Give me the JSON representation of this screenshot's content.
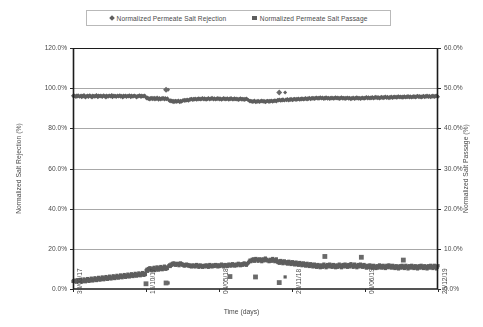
{
  "chart_data": {
    "type": "scatter",
    "title": "",
    "xlabel": "Time (days)",
    "ylabel": "Normalized Salt Rejection (%)",
    "y2label": "Normalized Salt Passage (%)",
    "grid": true,
    "legend_position": "top-center",
    "ylim": [
      0,
      120
    ],
    "y2lim": [
      0,
      60
    ],
    "ytick_labels": [
      "0.0%",
      "20.0%",
      "40.0%",
      "60.0%",
      "80.0%",
      "100.0%",
      "120.0%"
    ],
    "ytick_values": [
      0,
      20,
      40,
      60,
      80,
      100,
      120
    ],
    "y2tick_labels": [
      "0.0%",
      "10.0%",
      "20.0%",
      "30.0%",
      "40.0%",
      "50.0%",
      "60.0%"
    ],
    "y2tick_values": [
      0,
      10,
      20,
      30,
      40,
      50,
      60
    ],
    "xtick_labels": [
      "30/03/17",
      "16/10/17",
      "04/05/18",
      "20/11/18",
      "08/06/19",
      "25/12/19"
    ],
    "xtick_positions": [
      0,
      0.2,
      0.4,
      0.6,
      0.8,
      1.0
    ],
    "xlim_labels": [
      "30/03/17",
      "25/12/19"
    ],
    "series": [
      {
        "name": "Normalized Permeate  Salt Rejection",
        "marker": "diamond",
        "color": "#5e5e5e",
        "axis": "left",
        "values": [
          96.2,
          95.8,
          96.4,
          96.0,
          95.6,
          96.3,
          95.9,
          96.5,
          96.1,
          95.7,
          96.0,
          96.4,
          95.5,
          96.2,
          95.8,
          96.6,
          96.0,
          95.4,
          96.1,
          95.9,
          96.3,
          95.6,
          96.2,
          96.5,
          95.8,
          96.0,
          95.3,
          96.4,
          96.1,
          95.7,
          96.2,
          95.9,
          96.6,
          96.0,
          95.5,
          96.3,
          96.1,
          95.8,
          96.4,
          96.0,
          95.6,
          96.2,
          96.5,
          95.9,
          96.1,
          95.4,
          96.3,
          96.0,
          95.7,
          96.2,
          96.4,
          95.8,
          96.0,
          96.6,
          95.5,
          96.1,
          96.3,
          95.9,
          96.2,
          95.6,
          96.0,
          96.4,
          95.8,
          96.1,
          96.5,
          95.7,
          96.2,
          96.0,
          95.4,
          96.3,
          95.9,
          96.1,
          96.4,
          95.6,
          96.0,
          96.2,
          95.8,
          96.5,
          96.1,
          95.5,
          96.3,
          96.0,
          95.7,
          96.2,
          96.4,
          95.9,
          96.1,
          95.3,
          96.0,
          96.2,
          95.8,
          96.5,
          96.1,
          95.6,
          96.3,
          96.0,
          95.9,
          96.2,
          96.4,
          95.7,
          95.2,
          94.8,
          95.4,
          94.6,
          95.0,
          94.4,
          95.1,
          94.7,
          95.3,
          94.5,
          94.9,
          95.2,
          94.3,
          95.0,
          94.6,
          95.4,
          94.8,
          94.2,
          95.1,
          94.7,
          94.4,
          95.0,
          94.6,
          95.2,
          94.9,
          94.3,
          95.1,
          94.7,
          94.5,
          95.0,
          99.2,
          94.1,
          93.6,
          94.0,
          93.4,
          93.9,
          93.2,
          93.7,
          93.0,
          93.5,
          93.8,
          93.1,
          93.6,
          93.3,
          93.9,
          93.4,
          93.0,
          93.7,
          93.2,
          93.5,
          94.0,
          93.8,
          94.2,
          93.6,
          94.1,
          93.9,
          94.4,
          94.0,
          93.7,
          94.3,
          94.6,
          94.2,
          94.8,
          94.4,
          94.1,
          94.7,
          94.3,
          94.9,
          94.5,
          94.2,
          94.8,
          94.4,
          95.0,
          94.6,
          94.3,
          94.9,
          94.5,
          95.1,
          94.7,
          94.4,
          95.0,
          94.6,
          94.2,
          94.8,
          94.5,
          95.1,
          94.7,
          94.3,
          94.9,
          94.6,
          95.2,
          94.8,
          94.4,
          95.0,
          94.7,
          94.3,
          94.9,
          94.5,
          95.1,
          94.8,
          94.4,
          95.0,
          94.6,
          94.2,
          94.8,
          94.5,
          95.1,
          94.7,
          94.3,
          94.9,
          94.5,
          95.0,
          94.6,
          94.2,
          94.9,
          94.5,
          95.1,
          94.7,
          94.3,
          94.8,
          94.4,
          95.0,
          94.6,
          94.3,
          94.9,
          94.5,
          94.1,
          94.7,
          94.4,
          95.0,
          94.6,
          94.2,
          94.8,
          94.5,
          94.1,
          94.7,
          94.3,
          94.9,
          94.5,
          94.2,
          94.0,
          93.7,
          93.3,
          93.8,
          93.5,
          93.1,
          93.6,
          93.2,
          93.9,
          93.4,
          93.0,
          93.5,
          93.2,
          93.8,
          93.4,
          93.1,
          93.6,
          93.3,
          93.9,
          93.5,
          93.2,
          93.7,
          93.4,
          93.0,
          93.6,
          93.3,
          93.8,
          93.5,
          93.1,
          93.7,
          93.4,
          93.9,
          93.6,
          93.2,
          93.8,
          93.5,
          94.0,
          93.7,
          93.3,
          93.9,
          94.2,
          93.8,
          94.4,
          94.0,
          93.7,
          94.3,
          93.9,
          94.5,
          94.1,
          93.8,
          97.8,
          94.4,
          94.0,
          94.6,
          94.2,
          93.9,
          94.5,
          94.1,
          94.7,
          94.3,
          94.0,
          94.6,
          94.2,
          94.8,
          94.4,
          94.1,
          94.7,
          94.3,
          94.9,
          94.5,
          94.2,
          94.8,
          94.4,
          95.0,
          94.6,
          94.3,
          94.9,
          94.5,
          95.1,
          94.7,
          94.4,
          95.0,
          94.6,
          95.2,
          94.8,
          94.5,
          95.1,
          94.7,
          95.3,
          94.9,
          94.6,
          95.2,
          94.8,
          95.4,
          95.0,
          94.7,
          95.3,
          94.9,
          95.5,
          95.1,
          94.8,
          95.4,
          95.0,
          94.6,
          95.2,
          94.9,
          95.5,
          95.1,
          94.7,
          95.3,
          95.0,
          94.6,
          95.2,
          94.8,
          95.4,
          95.0,
          94.7,
          95.3,
          94.9,
          95.5,
          95.1,
          94.8,
          95.4,
          95.0,
          94.6,
          95.2,
          94.9,
          95.5,
          95.1,
          94.7,
          95.3,
          95.0,
          94.6,
          95.2,
          94.8,
          95.4,
          95.1,
          94.7,
          95.3,
          94.9,
          94.5,
          95.1,
          94.8,
          95.4,
          95.0,
          94.6,
          95.2,
          94.9,
          95.5,
          95.1,
          94.7,
          95.3,
          95.0,
          94.6,
          95.2,
          94.8,
          95.4,
          95.0,
          94.7,
          95.3,
          95.0,
          95.6,
          95.2,
          94.9,
          95.5,
          95.1,
          94.8,
          95.4,
          95.0,
          95.6,
          95.2,
          94.9,
          95.5,
          95.1,
          95.7,
          95.3,
          95.0,
          95.6,
          95.2,
          94.9,
          95.5,
          95.1,
          95.7,
          95.3,
          95.0,
          95.6,
          95.2,
          95.8,
          95.4,
          95.1,
          95.7,
          95.3,
          95.0,
          95.6,
          95.2,
          95.8,
          95.4,
          95.1,
          95.7,
          95.3,
          95.9,
          95.5,
          95.2,
          95.8,
          95.4,
          96.0,
          95.6,
          95.3,
          95.9,
          95.5,
          95.2,
          95.8,
          95.4,
          96.0,
          95.6,
          95.3,
          95.9,
          95.5,
          96.1,
          95.7,
          95.4,
          96.0,
          95.6,
          95.3,
          95.9,
          95.5,
          96.1,
          95.7,
          95.4,
          96.0,
          95.6,
          96.2,
          95.8,
          95.5,
          96.1,
          95.7,
          95.4,
          96.0,
          95.6,
          96.2,
          95.8,
          95.5,
          96.1,
          95.7,
          96.3,
          95.9,
          95.6,
          96.2,
          95.8,
          95.5,
          96.1,
          95.7,
          96.3,
          95.9,
          95.6,
          96.2,
          95.8,
          96.4,
          96.0,
          95.7
        ]
      },
      {
        "name": "Normalized Permeate  Salt Passage",
        "marker": "square",
        "color": "#5e5e5e",
        "axis": "right",
        "values": [
          1.9,
          2.1,
          1.8,
          2.2,
          2.0,
          1.7,
          2.3,
          1.9,
          2.1,
          1.8,
          2.4,
          2.0,
          1.7,
          2.2,
          1.9,
          2.5,
          2.1,
          1.8,
          2.3,
          2.0,
          2.6,
          2.2,
          1.9,
          2.4,
          2.1,
          2.7,
          2.3,
          2.0,
          2.5,
          2.2,
          2.8,
          2.4,
          2.1,
          2.6,
          2.3,
          2.9,
          2.5,
          2.2,
          2.7,
          2.4,
          3.0,
          2.6,
          2.3,
          2.8,
          2.5,
          3.1,
          2.7,
          2.4,
          2.9,
          2.6,
          3.2,
          2.8,
          2.5,
          3.0,
          2.7,
          3.3,
          2.9,
          2.6,
          3.1,
          2.8,
          3.4,
          3.0,
          2.7,
          3.2,
          2.9,
          3.5,
          3.1,
          2.8,
          3.3,
          3.0,
          3.6,
          3.2,
          2.9,
          3.4,
          3.1,
          3.7,
          3.3,
          3.0,
          3.5,
          3.2,
          3.8,
          3.4,
          3.1,
          3.6,
          3.3,
          3.9,
          3.5,
          3.2,
          3.7,
          3.4,
          4.0,
          3.6,
          3.3,
          3.8,
          3.5,
          4.1,
          3.7,
          3.4,
          3.9,
          3.6,
          4.6,
          4.9,
          4.4,
          5.1,
          4.7,
          5.3,
          4.8,
          5.0,
          4.5,
          5.2,
          4.9,
          5.4,
          4.6,
          5.0,
          4.8,
          5.5,
          5.1,
          4.7,
          5.3,
          4.9,
          5.6,
          5.2,
          4.8,
          5.4,
          5.0,
          5.7,
          5.3,
          4.9,
          5.5,
          5.1,
          1.5,
          5.8,
          6.0,
          5.6,
          6.2,
          5.9,
          6.4,
          6.1,
          6.5,
          6.2,
          5.9,
          6.3,
          6.0,
          6.4,
          6.1,
          5.8,
          6.2,
          6.5,
          6.1,
          6.3,
          5.9,
          6.1,
          5.7,
          6.0,
          5.8,
          6.2,
          5.9,
          6.1,
          5.7,
          6.0,
          5.6,
          5.9,
          5.5,
          5.8,
          6.0,
          5.6,
          5.9,
          5.5,
          5.8,
          6.1,
          5.7,
          5.9,
          5.4,
          5.7,
          6.0,
          5.6,
          5.8,
          5.4,
          5.7,
          5.9,
          5.5,
          5.8,
          6.0,
          5.6,
          5.9,
          5.4,
          5.7,
          6.1,
          5.6,
          5.9,
          5.5,
          5.8,
          6.0,
          5.6,
          5.9,
          6.1,
          5.7,
          6.0,
          5.5,
          5.8,
          6.0,
          5.6,
          5.9,
          6.2,
          5.8,
          6.0,
          5.5,
          5.9,
          6.1,
          5.7,
          6.0,
          5.6,
          5.9,
          6.2,
          5.8,
          6.1,
          5.7,
          6.0,
          6.3,
          5.9,
          6.1,
          5.7,
          6.0,
          6.2,
          5.8,
          6.1,
          6.4,
          6.0,
          6.2,
          5.8,
          6.1,
          6.3,
          5.9,
          6.2,
          6.5,
          6.1,
          6.3,
          5.9,
          6.2,
          6.4,
          6.6,
          6.9,
          7.2,
          6.8,
          7.0,
          7.4,
          7.1,
          7.5,
          6.9,
          7.3,
          7.6,
          7.2,
          7.4,
          6.9,
          7.3,
          7.5,
          7.1,
          7.4,
          6.8,
          7.2,
          7.5,
          7.0,
          7.3,
          7.7,
          7.1,
          7.4,
          7.0,
          7.2,
          6.8,
          7.1,
          7.4,
          6.9,
          7.2,
          7.6,
          7.0,
          7.3,
          6.8,
          7.1,
          7.5,
          6.9,
          6.6,
          7.0,
          6.4,
          6.8,
          7.1,
          6.5,
          6.9,
          6.3,
          6.7,
          7.0,
          3.0,
          6.4,
          6.8,
          6.2,
          6.6,
          6.9,
          6.3,
          6.7,
          6.1,
          6.5,
          6.8,
          6.2,
          6.6,
          6.0,
          6.4,
          6.7,
          6.1,
          6.5,
          5.9,
          6.3,
          6.6,
          6.0,
          6.4,
          5.8,
          6.2,
          6.5,
          5.9,
          6.3,
          5.7,
          6.1,
          6.4,
          5.8,
          6.2,
          5.6,
          6.0,
          6.3,
          5.7,
          6.1,
          5.5,
          5.9,
          6.2,
          5.6,
          6.0,
          5.4,
          5.8,
          6.1,
          5.5,
          5.9,
          5.3,
          5.7,
          6.0,
          5.4,
          5.8,
          6.2,
          5.6,
          5.9,
          5.3,
          5.7,
          6.1,
          5.5,
          5.8,
          6.2,
          5.6,
          6.0,
          5.4,
          5.8,
          6.1,
          5.5,
          5.9,
          5.3,
          5.7,
          6.0,
          5.4,
          5.8,
          6.2,
          5.6,
          5.9,
          5.3,
          5.7,
          6.1,
          5.5,
          5.8,
          6.2,
          5.6,
          6.0,
          5.4,
          5.7,
          6.1,
          5.5,
          5.9,
          6.3,
          5.7,
          6.0,
          5.4,
          5.8,
          6.2,
          5.6,
          5.9,
          5.3,
          5.7,
          6.1,
          5.5,
          5.8,
          6.2,
          5.6,
          6.0,
          5.4,
          5.8,
          6.1,
          5.5,
          5.8,
          5.2,
          5.6,
          5.9,
          5.3,
          5.7,
          6.0,
          5.4,
          5.8,
          5.2,
          5.6,
          5.9,
          5.3,
          5.7,
          5.1,
          5.5,
          5.8,
          5.2,
          5.6,
          6.0,
          5.4,
          5.8,
          5.2,
          5.6,
          5.9,
          5.3,
          5.7,
          5.1,
          5.5,
          5.9,
          5.3,
          5.7,
          6.0,
          5.4,
          5.8,
          5.2,
          5.6,
          5.9,
          5.3,
          5.7,
          5.1,
          5.5,
          5.8,
          5.2,
          5.6,
          5.0,
          5.4,
          5.8,
          5.2,
          5.6,
          5.9,
          5.3,
          5.7,
          5.1,
          5.5,
          5.9,
          5.3,
          5.7,
          5.0,
          5.4,
          5.8,
          5.2,
          5.6,
          5.9,
          5.3,
          5.7,
          5.1,
          5.5,
          5.8,
          5.2,
          5.6,
          5.0,
          5.4,
          5.8,
          5.2,
          5.6,
          5.9,
          5.3,
          5.7,
          5.1,
          5.5,
          5.8,
          5.2,
          5.6,
          5.0,
          5.4,
          5.8,
          5.2,
          5.6,
          5.9,
          5.3,
          5.7,
          5.1,
          5.5,
          5.9,
          5.3,
          5.7,
          5.0,
          5.4,
          5.8
        ]
      }
    ],
    "outliers": [
      {
        "series": "rejection",
        "x": 0.255,
        "y": 99.2
      },
      {
        "series": "rejection",
        "x": 0.565,
        "y": 97.8
      },
      {
        "series": "passage",
        "x": 0.2,
        "y": 1.3
      },
      {
        "series": "passage",
        "x": 0.255,
        "y": 1.5
      },
      {
        "series": "passage",
        "x": 0.43,
        "y": 3.1
      },
      {
        "series": "passage",
        "x": 0.5,
        "y": 3.0
      },
      {
        "series": "passage",
        "x": 0.565,
        "y": 1.6
      },
      {
        "series": "passage",
        "x": 0.69,
        "y": 8.1
      },
      {
        "series": "passage",
        "x": 0.79,
        "y": 7.9
      },
      {
        "series": "passage",
        "x": 0.905,
        "y": 7.2
      }
    ]
  },
  "legend": {
    "items": [
      {
        "label": "Normalized Permeate  Salt Rejection",
        "marker": "diamond"
      },
      {
        "label": "Normalized Permeate  Salt Passage",
        "marker": "square"
      }
    ]
  }
}
